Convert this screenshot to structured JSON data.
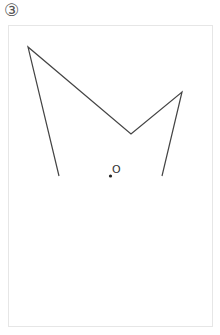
{
  "figure": {
    "number_label": "③",
    "point_label": "O",
    "line_color": "#444444",
    "dot_color": "#222222",
    "frame_color": "#e6e6e6"
  }
}
